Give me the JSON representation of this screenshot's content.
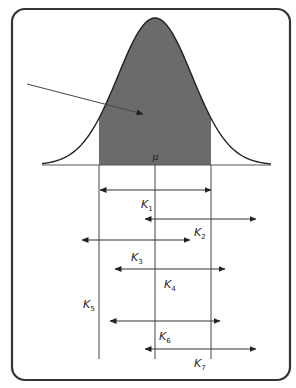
{
  "diagram": {
    "title": "",
    "center_label": "μ",
    "frame": {
      "x": 12,
      "y": 9,
      "width": 278,
      "height": 371,
      "radius": 13,
      "stroke": "#333333"
    },
    "colors": {
      "shade": "#6b6b6b",
      "stroke": "#222222",
      "line": "#444444"
    },
    "curve": {
      "mean_x": 155,
      "baseline_y": 165,
      "peak_y": 18,
      "x_start": 42,
      "x_end": 271,
      "sigma": 37
    },
    "shaded_region": {
      "x_left": 99,
      "x_right": 211
    },
    "pointer_arrow": {
      "x1": 27,
      "y1": 84,
      "x2": 143,
      "y2": 114
    },
    "vertical_lines": [
      {
        "name": "left-boundary",
        "x": 99,
        "y1": 165,
        "y2": 359
      },
      {
        "name": "mean",
        "x": 155,
        "y1": 165,
        "y2": 359
      },
      {
        "name": "right-boundary",
        "x": 211,
        "y1": 165,
        "y2": 359
      }
    ],
    "intervals": [
      {
        "label": "K",
        "sub": "1",
        "x1": 100,
        "x2": 211,
        "y": 190,
        "label_x": 141,
        "label_y": 208
      },
      {
        "label": "K",
        "sub": "2",
        "x1": 145,
        "x2": 256,
        "y": 219,
        "label_x": 194,
        "label_y": 236
      },
      {
        "label": "K",
        "sub": "3",
        "x1": 82,
        "x2": 190,
        "y": 240,
        "label_x": 131,
        "label_y": 261
      },
      {
        "label": "K",
        "sub": "4",
        "x1": 115,
        "x2": 225,
        "y": 269,
        "label_x": 164,
        "label_y": 288
      },
      {
        "label": "K",
        "sub": "5",
        "x1": null,
        "x2": null,
        "y": null,
        "label_x": 83,
        "label_y": 308
      },
      {
        "label": "K",
        "sub": "6",
        "x1": 110,
        "x2": 220,
        "y": 321,
        "label_x": 159,
        "label_y": 340
      },
      {
        "label": "K",
        "sub": "7",
        "x1": 145,
        "x2": 256,
        "y": 349,
        "label_x": 194,
        "label_y": 367
      }
    ]
  }
}
